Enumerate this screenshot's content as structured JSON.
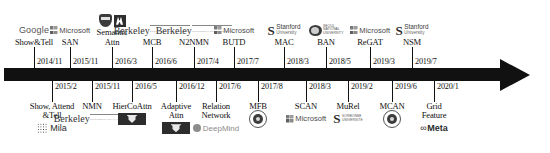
{
  "figure": {
    "kind": "research-timeline",
    "axis": {
      "arrow_direction": "right",
      "ink_color": "#111111"
    }
  },
  "dates_above": [
    {
      "text": "2014/11",
      "x": 34,
      "tick_x": 34
    },
    {
      "text": "2015/11",
      "x": 70,
      "tick_x": 70
    },
    {
      "text": "2016/3",
      "x": 112,
      "tick_x": 112
    },
    {
      "text": "2016/6",
      "x": 152,
      "tick_x": 152
    },
    {
      "text": "2017/4",
      "x": 194,
      "tick_x": 194
    },
    {
      "text": "2017/7",
      "x": 234,
      "tick_x": 234
    },
    {
      "text": "2018/3",
      "x": 284,
      "tick_x": 284
    },
    {
      "text": "2018/5",
      "x": 326,
      "tick_x": 326
    },
    {
      "text": "2019/3",
      "x": 370,
      "tick_x": 370
    },
    {
      "text": "2019/7",
      "x": 412,
      "tick_x": 412
    }
  ],
  "dates_below": [
    {
      "text": "2015/2",
      "x": 52
    },
    {
      "text": "2015/11",
      "x": 92
    },
    {
      "text": "2016/5",
      "x": 132
    },
    {
      "text": "2016/12",
      "x": 176
    },
    {
      "text": "2017/6",
      "x": 216
    },
    {
      "text": "2017/8",
      "x": 258
    },
    {
      "text": "2018/3",
      "x": 306
    },
    {
      "text": "2019/2",
      "x": 348
    },
    {
      "text": "2019/6",
      "x": 392
    },
    {
      "text": "2020/1",
      "x": 434
    }
  ],
  "entries_above": [
    {
      "label": "Show&Tell",
      "x": 34,
      "logos": [
        "google"
      ]
    },
    {
      "label": "SAN",
      "x": 70,
      "logos": [
        "microsoft"
      ]
    },
    {
      "label": "Semantic\nAttn",
      "x": 112,
      "logos": [
        "crest",
        "dark-square"
      ]
    },
    {
      "label": "MCB",
      "x": 152,
      "logos": [
        "berkeley"
      ]
    },
    {
      "label": "N2NMN",
      "x": 194,
      "logos": [
        "berkeley"
      ]
    },
    {
      "label": "BUTD",
      "x": 234,
      "logos": [
        "microsoft"
      ]
    },
    {
      "label": "MAC",
      "x": 284,
      "logos": [
        "stanford"
      ]
    },
    {
      "label": "BAN",
      "x": 326,
      "logos": [
        "seoul"
      ]
    },
    {
      "label": "ReGAT",
      "x": 370,
      "logos": [
        "microsoft"
      ]
    },
    {
      "label": "NSM",
      "x": 412,
      "logos": [
        "stanford"
      ]
    }
  ],
  "entries_below": [
    {
      "label": "Show, Attend\n&Tell",
      "x": 52,
      "logos": [
        "mila"
      ]
    },
    {
      "label": "NMN",
      "x": 92,
      "logos": [
        "berkeley"
      ]
    },
    {
      "label": "HierCoAttn",
      "x": 132,
      "logos": [
        "virginia-tech"
      ]
    },
    {
      "label": "Adaptive\nAttn",
      "x": 176,
      "logos": [
        "virginia-tech"
      ]
    },
    {
      "label": "Relation\nNetwork",
      "x": 216,
      "logos": [
        "deepmind"
      ]
    },
    {
      "label": "MFB",
      "x": 258,
      "logos": [
        "seal"
      ]
    },
    {
      "label": "SCAN",
      "x": 306,
      "logos": [
        "microsoft"
      ]
    },
    {
      "label": "MuRel",
      "x": 348,
      "logos": [
        "sorbonne"
      ]
    },
    {
      "label": "MCAN",
      "x": 392,
      "logos": [
        "seal"
      ]
    },
    {
      "label": "Grid\nFeature",
      "x": 434,
      "logos": [
        "meta"
      ]
    }
  ],
  "logo_text": {
    "google": "Google",
    "microsoft": "Microsoft",
    "berkeley": "Berkeley",
    "berkeley_sub": "UNIVERSITY OF CALIFORNIA",
    "stanford": "Stanford",
    "stanford_sub": "University",
    "seoul_line1": "SEOUL",
    "seoul_line2": "NATIONAL",
    "seoul_line3": "UNIVERSITY",
    "deepmind": "DeepMind",
    "sorbonne_line1": "SORBONNE",
    "sorbonne_line2": "UNIVERSITE",
    "mila": "Mila",
    "meta_mark": "∞",
    "meta": "Meta"
  }
}
